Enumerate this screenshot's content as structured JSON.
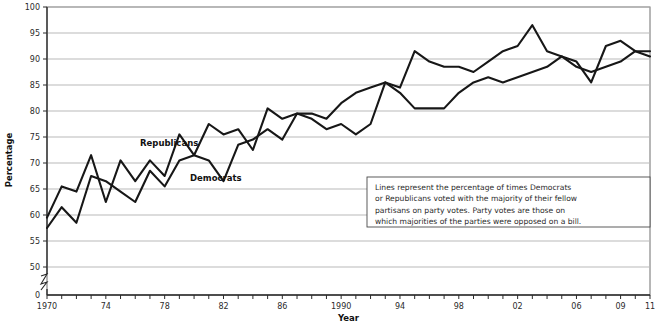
{
  "chart_data": {
    "type": "line",
    "title": "",
    "xlabel": "Year",
    "ylabel": "Percentage",
    "ylim": [
      50,
      100
    ],
    "y_ticks": [
      "0",
      "50",
      "55",
      "60",
      "65",
      "70",
      "75",
      "80",
      "85",
      "90",
      "95",
      "100"
    ],
    "y_axis_break": true,
    "xlim": [
      1970,
      2011
    ],
    "x_ticks_labeled": [
      "1970",
      "74",
      "78",
      "82",
      "86",
      "1990",
      "94",
      "98",
      "02",
      "06",
      "09",
      "11"
    ],
    "x_ticks_labeled_years": [
      1970,
      1974,
      1978,
      1982,
      1986,
      1990,
      1994,
      1998,
      2002,
      2006,
      2009,
      2011
    ],
    "grid": true,
    "legend_position": "inline-labels",
    "x": [
      1970,
      1971,
      1972,
      1973,
      1974,
      1975,
      1976,
      1977,
      1978,
      1979,
      1980,
      1981,
      1982,
      1983,
      1984,
      1985,
      1986,
      1987,
      1988,
      1989,
      1990,
      1991,
      1992,
      1993,
      1994,
      1995,
      1996,
      1997,
      1998,
      1999,
      2000,
      2001,
      2002,
      2003,
      2004,
      2005,
      2006,
      2007,
      2008,
      2009,
      2010,
      2011
    ],
    "series": [
      {
        "name": "Republicans",
        "values": [
          59.5,
          65.5,
          64.5,
          71.5,
          62.5,
          70.5,
          66.5,
          70.5,
          67.5,
          75.5,
          71.5,
          77.5,
          75.5,
          76.5,
          72.5,
          80.5,
          78.5,
          79.5,
          79.5,
          78.5,
          81.5,
          83.5,
          84.5,
          85.5,
          84.5,
          91.5,
          89.5,
          88.5,
          88.5,
          87.5,
          89.5,
          91.5,
          92.5,
          96.5,
          91.5,
          90.5,
          88.5,
          87.5,
          88.5,
          89.5,
          91.5,
          90.5
        ]
      },
      {
        "name": "Democrats",
        "values": [
          57.5,
          61.5,
          58.5,
          67.5,
          66.5,
          64.5,
          62.5,
          68.5,
          65.5,
          70.5,
          71.5,
          70.5,
          66.5,
          73.5,
          74.5,
          76.5,
          74.5,
          79.5,
          78.5,
          76.5,
          77.5,
          75.5,
          77.5,
          85.5,
          83.5,
          80.5,
          80.5,
          80.5,
          83.5,
          85.5,
          86.5,
          85.5,
          86.5,
          87.5,
          88.5,
          90.5,
          89.5,
          85.5,
          92.5,
          93.5,
          91.5,
          91.5
        ]
      }
    ],
    "annotation": {
      "lines": [
        "Lines represent the percentage of times Democrats",
        "or Republicans voted with the majority of their fellow",
        "partisans on party votes. Party votes are those on",
        "which majorities of the parties were opposed on a bill."
      ]
    }
  },
  "labels": {
    "republicans": "Republicans",
    "democrats": "Democrats",
    "y_axis_title": "Percentage",
    "x_axis_title": "Year"
  },
  "colors": {
    "line": "#171717",
    "grid": "#b9b9b9",
    "axis": "#2a2a2a",
    "background": "#ffffff"
  }
}
